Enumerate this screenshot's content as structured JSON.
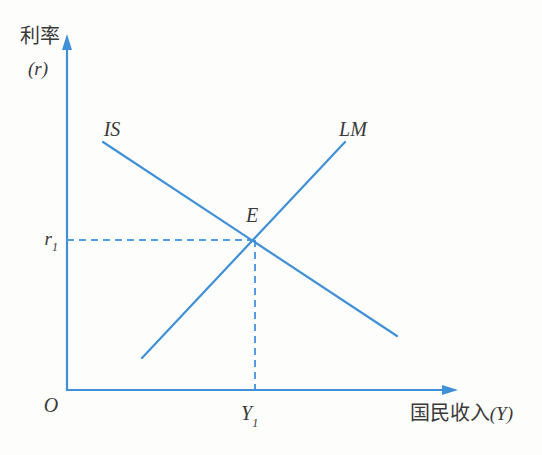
{
  "figure": {
    "background": "#fdfdfc",
    "line_color": "#4090d8",
    "dash_color": "#549ce2",
    "text_color": "#3a3a3a"
  },
  "chart_data": {
    "type": "line",
    "title": "",
    "xlabel": "国民收入(Y)",
    "ylabel": "利率(r)",
    "grid": "off",
    "legend": "none",
    "axis_labels": {
      "y_title": "利率",
      "y_symbol": "(r)",
      "x_title": "国民收入",
      "x_symbol": "(Y)",
      "origin": "O"
    },
    "series": [
      {
        "name": "IS",
        "label": "IS",
        "slope": "negative",
        "px_points": [
          [
            103,
            142
          ],
          [
            397,
            336
          ]
        ]
      },
      {
        "name": "LM",
        "label": "LM",
        "slope": "positive",
        "px_points": [
          [
            142,
            358
          ],
          [
            345,
            142
          ]
        ]
      }
    ],
    "equilibrium": {
      "label": "E",
      "px": [
        255,
        240
      ],
      "rate_label": "r",
      "rate_sub": "1",
      "income_label": "Y",
      "income_sub": "1"
    },
    "axes_px": {
      "origin": [
        67,
        390
      ],
      "y_arrow_tip": [
        67,
        34
      ],
      "x_arrow_tip": [
        458,
        390
      ]
    }
  }
}
